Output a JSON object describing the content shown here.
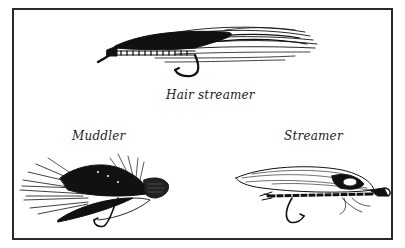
{
  "figure": {
    "captions": {
      "hair_streamer": "Hair streamer",
      "muddler": "Muddler",
      "streamer": "Streamer"
    },
    "colors": {
      "ink": "#111111",
      "border": "#2a2a2a",
      "background": "#ffffff"
    }
  }
}
